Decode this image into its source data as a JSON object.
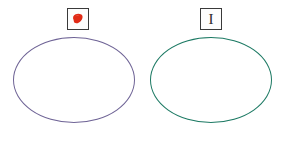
{
  "diagram": {
    "background_color": "#ffffff",
    "width": 285,
    "height": 142
  },
  "legend": {
    "items": [
      {
        "id": "red-blob",
        "icon_name": "red-blob-icon",
        "symbol": "",
        "swatch_color": "#e12b16",
        "box_border_color": "#3a3a3a",
        "description": "red irregular blob marker"
      },
      {
        "id": "i-beam",
        "icon_name": "i-beam-icon",
        "symbol": "I",
        "swatch_color": "#2b2b2b",
        "box_border_color": "#3a3a3a",
        "description": "serif capital I beam marker"
      }
    ]
  },
  "shapes": {
    "ellipses": [
      {
        "id": "ellipse-purple",
        "label": "",
        "stroke_color": "#6f6496",
        "fill": "none",
        "cx": 74,
        "cy": 80,
        "rx": 61,
        "ry": 43
      },
      {
        "id": "ellipse-green",
        "label": "",
        "stroke_color": "#1d7a64",
        "fill": "none",
        "cx": 211,
        "cy": 80,
        "rx": 61,
        "ry": 43
      }
    ]
  }
}
